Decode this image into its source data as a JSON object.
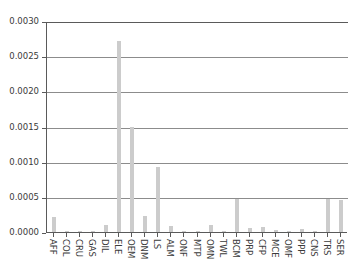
{
  "chart_data": {
    "type": "bar",
    "title": "",
    "subtitle": "",
    "xlabel": "",
    "ylabel": "",
    "ylim": [
      0.0,
      0.003
    ],
    "xlim_categories": 23,
    "grid": true,
    "grid_axis": "y",
    "legend": false,
    "legend_position": "none",
    "bar_color": "#cccccc",
    "axis_color": "#5a5a5a",
    "grid_color": "#8c8c8c",
    "text_color": "#3b3b3b",
    "xtick_rotation": 90,
    "ytick_labels": [
      "0.0000",
      "0.0005",
      "0.0010",
      "0.0015",
      "0.0020",
      "0.0025",
      "0.0030"
    ],
    "ytick_values": [
      0.0,
      0.0005,
      0.001,
      0.0015,
      0.002,
      0.0025,
      0.003
    ],
    "categories": [
      "AFF",
      "COL",
      "CRU",
      "GAS",
      "DIL",
      "ELE",
      "OEM",
      "DNM",
      "LS",
      "ALM",
      "ONF",
      "MTP",
      "OMN",
      "TWL",
      "BCM",
      "PRP",
      "CFP",
      "MCE",
      "OMF",
      "PPP",
      "CNS",
      "TRS",
      "SER"
    ],
    "values": [
      0.00021,
      1e-05,
      1e-05,
      2e-05,
      0.0001,
      0.00271,
      0.0015,
      0.00023,
      0.00092,
      8e-05,
      2e-05,
      1e-05,
      0.0001,
      2e-05,
      0.00047,
      5e-05,
      7e-05,
      3e-05,
      2e-05,
      4e-05,
      2e-05,
      0.00047,
      0.00046
    ]
  }
}
